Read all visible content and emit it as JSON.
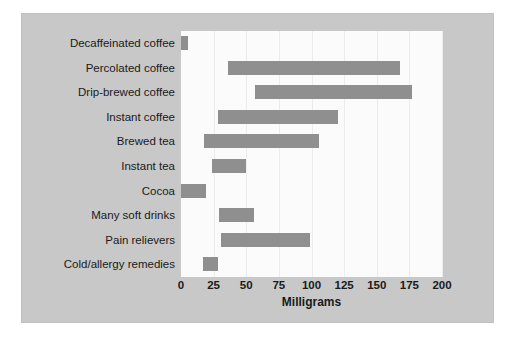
{
  "chart_data": {
    "type": "bar",
    "orientation": "horizontal",
    "subtype": "floating-range-bar",
    "title": "",
    "xlabel": "Milligrams",
    "ylabel": "",
    "xlim": [
      0,
      200
    ],
    "xticks": [
      0,
      25,
      50,
      75,
      100,
      125,
      150,
      175,
      200
    ],
    "grid": true,
    "legend": null,
    "bar_color": "#8f8f8f",
    "plot_background": "#fbfbfb",
    "figure_background": "#c8c8c8",
    "categories": [
      "Decaffeinated coffee",
      "Percolated coffee",
      "Drip-brewed coffee",
      "Instant coffee",
      "Brewed tea",
      "Instant tea",
      "Cocoa",
      "Many soft drinks",
      "Pain relievers",
      "Cold/allergy remedies"
    ],
    "ranges": [
      {
        "category": "Decaffeinated coffee",
        "low": 0,
        "high": 5
      },
      {
        "category": "Percolated coffee",
        "low": 36,
        "high": 168
      },
      {
        "category": "Drip-brewed coffee",
        "low": 57,
        "high": 177
      },
      {
        "category": "Instant coffee",
        "low": 28,
        "high": 120
      },
      {
        "category": "Brewed tea",
        "low": 18,
        "high": 106
      },
      {
        "category": "Instant tea",
        "low": 24,
        "high": 50
      },
      {
        "category": "Cocoa",
        "low": 0,
        "high": 19
      },
      {
        "category": "Many soft drinks",
        "low": 29,
        "high": 56
      },
      {
        "category": "Pain relievers",
        "low": 31,
        "high": 99
      },
      {
        "category": "Cold/allergy remedies",
        "low": 17,
        "high": 28
      }
    ]
  }
}
